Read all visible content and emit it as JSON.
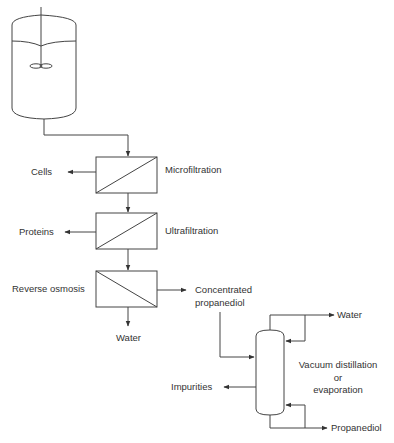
{
  "diagram": {
    "units": {
      "fermenter": {
        "name": "fermenter-tank"
      },
      "microfiltration": {
        "label": "Microfiltration",
        "output_side": "Cells"
      },
      "ultrafiltration": {
        "label": "Ultrafiltration",
        "output_side": "Proteins"
      },
      "reverse_osmosis": {
        "label": "Reverse osmosis",
        "output_bottom": "Water",
        "output_right_line1": "Concentrated",
        "output_right_line2": "propanediol"
      },
      "column": {
        "label_line1": "Vacuum distillation",
        "label_line2": "or",
        "label_line3": "evaporation",
        "top_output": "Water",
        "side_output": "Impurities",
        "bottom_output": "Propanediol"
      }
    },
    "colors": {
      "line": "#444444",
      "background": "#ffffff"
    }
  }
}
